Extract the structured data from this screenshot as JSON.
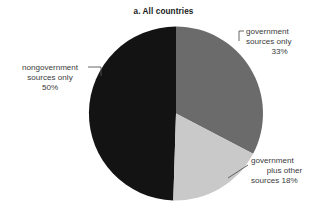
{
  "chart_data": {
    "type": "pie",
    "title": "a. All countries",
    "xlabel": "",
    "ylabel": "",
    "categories": [
      "government sources only",
      "government plus other sources",
      "nongovernment sources only"
    ],
    "values": [
      33,
      18,
      50
    ],
    "value_labels": [
      "33%",
      "18%",
      "50%"
    ],
    "unit": "%",
    "start_angle_deg": 0,
    "direction": "clockwise",
    "grid": false,
    "legend": "none",
    "labels_placement": "outside-with-leader-lines",
    "colors": [
      "#6b6b6b",
      "#c9c9c9",
      "#131313"
    ],
    "slices": [
      {
        "name": "government sources only",
        "value": 33,
        "percent_text": "33%",
        "color": "#6b6b6b",
        "label_lines": [
          "government",
          "sources only",
          "33%"
        ]
      },
      {
        "name": "government plus other sources",
        "value": 18,
        "percent_text": "18%",
        "color": "#c9c9c9",
        "label_lines": [
          "government",
          "plus other",
          "sources 18%"
        ]
      },
      {
        "name": "nongovernment sources only",
        "value": 50,
        "percent_text": "50%",
        "color": "#131313",
        "label_lines": [
          "nongovernment",
          "sources only",
          "50%"
        ]
      }
    ]
  },
  "title": "a. All countries",
  "labels": {
    "government_only": {
      "line1": "government",
      "line2": "sources only",
      "line3": "33%"
    },
    "nongovernment_only": {
      "line1": "nongovernment",
      "line2": "sources only",
      "line3": "50%"
    },
    "government_plus_other": {
      "line1": "government",
      "line2": "plus other",
      "line3": "sources 18%"
    }
  },
  "geometry": {
    "center_x": 176,
    "center_y": 113.5,
    "radius": 87
  },
  "colors": {
    "slice_government_only": "#6b6b6b",
    "slice_government_plus_other": "#c9c9c9",
    "slice_nongovernment_only": "#131313",
    "text": "#3b3b3b",
    "title": "#1a1a1a",
    "leader_line": "#555555",
    "background": "#ffffff"
  }
}
